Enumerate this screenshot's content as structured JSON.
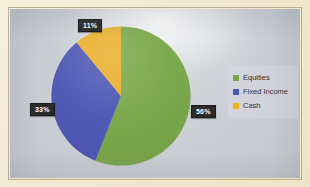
{
  "chart_data": {
    "type": "pie",
    "title": "",
    "categories": [
      "Equities",
      "Fixed Income",
      "Cash"
    ],
    "values": [
      56,
      33,
      11
    ],
    "value_labels": [
      "56%",
      "33%",
      "11%"
    ],
    "unit": "percent",
    "total": 100,
    "start_angle_deg": 0,
    "direction": "clockwise",
    "legend_position": "right",
    "grid": false,
    "colors": [
      "#76a942",
      "#4a55bb",
      "#f0b01f"
    ],
    "slices": [
      {
        "label": "Equities",
        "value": 56,
        "display": "56%",
        "color": "#76a942"
      },
      {
        "label": "Fixed Income",
        "value": 33,
        "display": "33%",
        "color": "#4a55bb"
      },
      {
        "label": "Cash",
        "value": 11,
        "display": "11%",
        "color": "#f0b01f"
      }
    ]
  },
  "legend": {
    "items": [
      {
        "label": "Equities",
        "color": "#76a942"
      },
      {
        "label": "Fixed Income",
        "color": "#4a55bb"
      },
      {
        "label": "Cash",
        "color": "#f0b01f"
      }
    ]
  },
  "data_labels": {
    "cash": "11%",
    "fixed_income": "33%",
    "equities": "56%"
  },
  "theme": {
    "slide_background": "#c9ccd2",
    "photo_border": "#f2e9d2",
    "label_background": "#2b2b2b",
    "label_text": "#ffffff",
    "legend_panel": "#d6d6e2"
  }
}
